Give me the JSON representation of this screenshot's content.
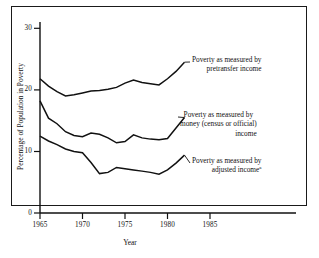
{
  "chart_data": {
    "type": "line",
    "title": "",
    "xlabel": "Year",
    "ylabel": "Percentage of Population in Poverty",
    "xlim": [
      1965,
      1987
    ],
    "ylim": [
      0,
      32
    ],
    "xticks": [
      "1965",
      "1970",
      "1975",
      "1980",
      "1985"
    ],
    "yticks": [
      "0",
      "10",
      "20",
      "30"
    ],
    "grid": false,
    "legend_position": "inline-right-annotations",
    "series": [
      {
        "name": "Poverty as measured by pretransfer income",
        "annotation_lines": [
          "Poverty as measured by",
          "pretransfer income"
        ],
        "x": [
          1965,
          1966,
          1967,
          1968,
          1969,
          1970,
          1971,
          1972,
          1973,
          1974,
          1975,
          1976,
          1977,
          1978,
          1979,
          1980,
          1981,
          1982
        ],
        "values": [
          21.8,
          20.6,
          19.7,
          19.0,
          19.2,
          19.5,
          19.8,
          19.9,
          20.1,
          20.4,
          21.1,
          21.6,
          21.2,
          21.0,
          20.8,
          21.8,
          23.0,
          24.5
        ]
      },
      {
        "name": "Poverty as measured by money (census or official) income",
        "annotation_lines": [
          "Poverty as measured by",
          "money (census or official)",
          "income"
        ],
        "x": [
          1965,
          1966,
          1967,
          1968,
          1969,
          1970,
          1971,
          1972,
          1973,
          1974,
          1975,
          1976,
          1977,
          1978,
          1979,
          1980,
          1981,
          1982
        ],
        "values": [
          18.2,
          15.4,
          14.5,
          13.2,
          12.6,
          12.4,
          13.0,
          12.8,
          12.2,
          11.4,
          11.6,
          12.7,
          12.2,
          12.0,
          11.9,
          12.1,
          13.8,
          15.5
        ],
        "footnote_marker": ""
      },
      {
        "name": "Poverty as measured by adjusted income",
        "annotation_lines": [
          "Poverty as measured by",
          "adjusted income"
        ],
        "footnote_marker": "a",
        "x": [
          1965,
          1966,
          1967,
          1968,
          1969,
          1970,
          1971,
          1972,
          1973,
          1974,
          1975,
          1976,
          1977,
          1978,
          1979,
          1980,
          1981,
          1982
        ],
        "values": [
          12.5,
          11.7,
          11.1,
          10.4,
          10.0,
          9.8,
          8.2,
          6.4,
          6.6,
          7.4,
          7.2,
          7.0,
          6.8,
          6.6,
          6.3,
          7.0,
          8.1,
          9.4
        ]
      }
    ]
  },
  "annotations": {
    "pretransfer": {
      "line1": "Poverty as measured by",
      "line2": "pretransfer income"
    },
    "money": {
      "line1": "Poverty as measured by",
      "line2": "money (census or official)",
      "line3": "income"
    },
    "adjusted": {
      "line1": "Poverty as measured by",
      "line2": "adjusted income",
      "marker": "a"
    }
  },
  "axes": {
    "ylabel": "Percentage of Population in Poverty",
    "xlabel": "Year",
    "yticks": [
      "30",
      "20",
      "10",
      "0"
    ],
    "xticks": [
      "1965",
      "1970",
      "1975",
      "1980",
      "1985"
    ]
  }
}
